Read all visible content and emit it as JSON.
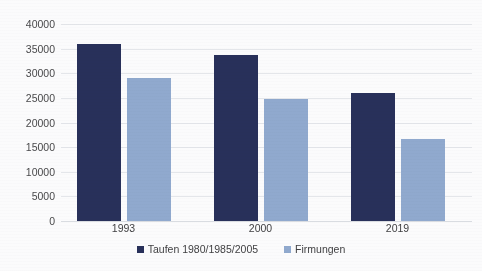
{
  "chart_data": {
    "type": "bar",
    "title": "",
    "subtitle": "",
    "xlabel": "",
    "ylabel": "",
    "categories": [
      "1993",
      "2000",
      "2019"
    ],
    "series": [
      {
        "name": "Taufen 1980/1985/2005",
        "color": "#28305a",
        "values": [
          35900,
          33700,
          26000
        ]
      },
      {
        "name": "Firmungen",
        "color": "#90a9ce",
        "values": [
          29000,
          24700,
          16600
        ]
      }
    ],
    "ylim": [
      0,
      40000
    ],
    "ytick_step": 5000,
    "ytick_labels": [
      "0",
      "5000",
      "10000",
      "15000",
      "20000",
      "25000",
      "30000",
      "35000",
      "40000"
    ],
    "ytick_values": [
      0,
      5000,
      10000,
      15000,
      20000,
      25000,
      30000,
      35000,
      40000
    ],
    "grid": true,
    "grid_axis": "y",
    "legend_position": "bottom",
    "annotations": []
  },
  "colors": {
    "background": "#fbfbfc",
    "gridline": "#e4e6ea",
    "baseline": "#d9dce1",
    "tick_text": "#49494b",
    "label_text": "#3f3f41"
  }
}
